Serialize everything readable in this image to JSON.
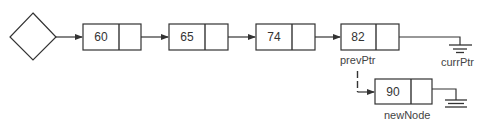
{
  "diagram": {
    "type": "linked-list-insertion",
    "head": {
      "shape": "diamond"
    },
    "nodes": [
      {
        "id": "n1",
        "value": "60"
      },
      {
        "id": "n2",
        "value": "65"
      },
      {
        "id": "n3",
        "value": "74"
      },
      {
        "id": "n4",
        "value": "82",
        "label": "prevPtr"
      }
    ],
    "terminal": {
      "label": "currPtr",
      "symbol": "null-ground"
    },
    "new_node": {
      "value": "90",
      "label": "newNode",
      "next": "null-ground"
    },
    "edges": [
      {
        "from": "head",
        "to": "n1",
        "style": "solid-arrow"
      },
      {
        "from": "n1",
        "to": "n2",
        "style": "solid-arrow"
      },
      {
        "from": "n2",
        "to": "n3",
        "style": "solid-arrow"
      },
      {
        "from": "n3",
        "to": "n4",
        "style": "solid-arrow"
      },
      {
        "from": "n4",
        "to": "currPtr-null",
        "style": "solid-line"
      },
      {
        "from": "prevPtr",
        "to": "newNode",
        "style": "dashed-arrow"
      },
      {
        "from": "newNode",
        "to": "null",
        "style": "solid-line"
      }
    ],
    "colors": {
      "stroke": "#333333",
      "text": "#333333",
      "background": "#ffffff"
    }
  }
}
